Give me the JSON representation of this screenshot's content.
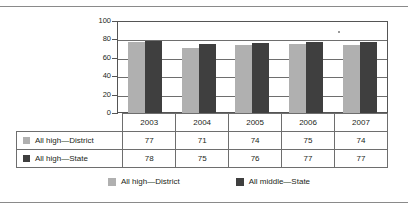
{
  "chart_data": {
    "type": "bar",
    "title": "",
    "xlabel": "",
    "ylabel": "",
    "ylim": [
      0,
      100
    ],
    "yticks": [
      "100",
      "80",
      "60",
      "40",
      "20",
      "0"
    ],
    "grid": true,
    "legend_position": "bottom",
    "categories": [
      "2003",
      "2004",
      "2005",
      "2006",
      "2007"
    ],
    "series": [
      {
        "name": "All high—District",
        "legend_name": "All high—District",
        "color": "#b0b0b0",
        "values": [
          77,
          71,
          74,
          75,
          74
        ]
      },
      {
        "name": "All high—State",
        "legend_name": "All middle—State",
        "color": "#3f3f3f",
        "values": [
          78,
          75,
          76,
          77,
          77
        ]
      }
    ]
  },
  "table": {
    "header_row": [
      "2003",
      "2004",
      "2005",
      "2006",
      "2007"
    ],
    "rows": [
      {
        "label": "All high—District",
        "swatch": "light",
        "values": [
          "77",
          "71",
          "74",
          "75",
          "74"
        ]
      },
      {
        "label": "All high—State",
        "swatch": "dark",
        "values": [
          "78",
          "75",
          "76",
          "77",
          "77"
        ]
      }
    ]
  },
  "legend": {
    "items": [
      {
        "label": "All high—District",
        "swatch": "light"
      },
      {
        "label": "All middle—State",
        "swatch": "dark"
      }
    ]
  },
  "colors": {
    "series_light": "#b0b0b0",
    "series_dark": "#3f3f3f",
    "gridline": "#6e6e6e",
    "axis": "#555555",
    "rule": "#8a8a8a",
    "text": "#231f20"
  }
}
